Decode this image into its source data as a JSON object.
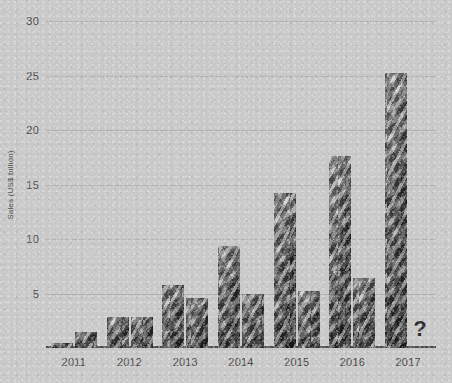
{
  "chart_data": {
    "type": "bar",
    "title": "",
    "xlabel": "",
    "ylabel": "Sales (US$ billion)",
    "categories": [
      "2011",
      "2012",
      "2013",
      "2014",
      "2015",
      "2016",
      "2017"
    ],
    "series": [
      {
        "name": "Series 1",
        "values": [
          0.5,
          2.8,
          5.8,
          9.4,
          14.2,
          17.6,
          25.2
        ]
      },
      {
        "name": "Series 2",
        "values": [
          1.5,
          2.8,
          4.6,
          5.0,
          5.2,
          6.4,
          null
        ]
      }
    ],
    "ylim": [
      0,
      30
    ],
    "yticks": [
      5,
      10,
      15,
      20,
      25,
      30
    ],
    "ytick_labels": [
      "5",
      "10",
      "15",
      "20",
      "25",
      "30"
    ],
    "grid": true,
    "legend": "none",
    "annotations": [
      {
        "text": "?",
        "category": "2017",
        "series": "Series 2",
        "note": "second 2017 bar replaced by question mark"
      }
    ],
    "bar_fill": "banknote-photo-texture",
    "colors": {
      "background": "#c9c9c9",
      "gridline": "#b0b0b0",
      "axis": "#4c4c4c",
      "tick_text": "#4a4a4a",
      "annotation": "#2c2c2c"
    }
  }
}
